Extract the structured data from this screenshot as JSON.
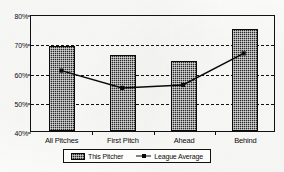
{
  "chart_data": {
    "type": "bar",
    "title": "",
    "xlabel": "",
    "ylabel": "",
    "categories": [
      "All Pitches",
      "First Pitch",
      "Ahead",
      "Behind"
    ],
    "ylim": [
      40,
      80
    ],
    "yticks": [
      {
        "value": 80,
        "label": "80%"
      },
      {
        "value": 70,
        "label": "70%"
      },
      {
        "value": 60,
        "label": "60%"
      },
      {
        "value": 50,
        "label": "50%"
      },
      {
        "value": 40,
        "label": "40%"
      }
    ],
    "gridlines": [
      70,
      60,
      50
    ],
    "grid": true,
    "legend_position": "bottom",
    "series": [
      {
        "name": "This Pitcher",
        "type": "bar",
        "values": [
          69,
          66,
          64,
          75
        ],
        "color": "#2a2a2a"
      },
      {
        "name": "League Average",
        "type": "line",
        "values": [
          61,
          55,
          56,
          67
        ],
        "color": "#0a0a0a",
        "marker": "square"
      }
    ]
  },
  "legend": {
    "items": [
      {
        "label": "This Pitcher",
        "symbol": "bar-swatch"
      },
      {
        "label": "League Average",
        "symbol": "line-marker-swatch"
      }
    ]
  }
}
